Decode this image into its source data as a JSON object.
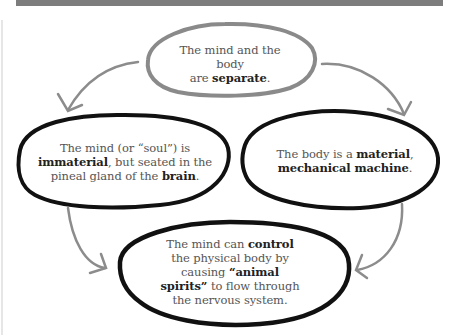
{
  "diagram": {
    "type": "cycle",
    "colors": {
      "top_bar": "#7d7d7d",
      "top_node_outline": "#8a8a8a",
      "node_outline": "#111111",
      "arrow": "#8c8c8c",
      "text": "#555555",
      "bold_text": "#222222"
    },
    "nodes": {
      "top": {
        "parts": [
          "The mind and the body",
          "are ",
          "separate",
          "."
        ]
      },
      "left": {
        "parts": [
          "The mind (or “soul”) is",
          "immaterial",
          ", but seated in the",
          "pineal gland of the ",
          "brain",
          "."
        ]
      },
      "right": {
        "parts": [
          "The body is a ",
          "material",
          ",",
          "mechanical machine",
          "."
        ]
      },
      "bottom": {
        "parts": [
          "The mind can ",
          "control",
          "the physical body by",
          "causing ",
          "“animal",
          "spirits”",
          " to flow through",
          "the nervous system."
        ]
      }
    },
    "edges": [
      {
        "from": "top",
        "to": "left"
      },
      {
        "from": "top",
        "to": "right"
      },
      {
        "from": "left",
        "to": "bottom"
      },
      {
        "from": "right",
        "to": "bottom"
      }
    ],
    "arrow_icon": "arrow-head-icon"
  }
}
